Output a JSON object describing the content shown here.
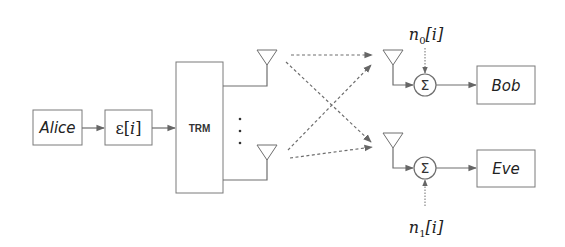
{
  "diagram": {
    "type": "block-diagram",
    "colors": {
      "stroke": "#6e6e6e",
      "box_border": "#7a7a7a",
      "text": "#222222",
      "background": "#ffffff"
    },
    "blocks": {
      "alice": {
        "label": "Alice"
      },
      "epsilon": {
        "label": "ε[i]",
        "symbol": "ε",
        "index": "i"
      },
      "trm": {
        "label": "TRM"
      },
      "bob": {
        "label": "Bob"
      },
      "eve": {
        "label": "Eve"
      }
    },
    "summers": [
      {
        "id": "sum-bob",
        "symbol": "Σ"
      },
      {
        "id": "sum-eve",
        "symbol": "Σ"
      }
    ],
    "noise": [
      {
        "id": "n0",
        "base": "n",
        "subscript": "0",
        "index": "i"
      },
      {
        "id": "n1",
        "base": "n",
        "subscript": "1",
        "index": "i"
      }
    ],
    "antennas": {
      "transmit": [
        "tx-antenna-top",
        "tx-antenna-bottom"
      ],
      "receive": [
        "rx-antenna-bob",
        "rx-antenna-eve"
      ]
    },
    "ellipsis": "⋮",
    "edges": [
      {
        "from": "Alice",
        "to": "ε[i]",
        "style": "solid"
      },
      {
        "from": "ε[i]",
        "to": "TRM",
        "style": "solid"
      },
      {
        "from": "TRM",
        "to": "tx-antenna-top",
        "style": "solid"
      },
      {
        "from": "TRM",
        "to": "tx-antenna-bottom",
        "style": "solid"
      },
      {
        "from": "tx-antenna-top",
        "to": "rx-antenna-bob",
        "style": "dashed"
      },
      {
        "from": "tx-antenna-top",
        "to": "rx-antenna-eve",
        "style": "dashed"
      },
      {
        "from": "tx-antenna-bottom",
        "to": "rx-antenna-bob",
        "style": "dashed"
      },
      {
        "from": "tx-antenna-bottom",
        "to": "rx-antenna-eve",
        "style": "dashed"
      },
      {
        "from": "rx-antenna-bob",
        "to": "sum-bob",
        "style": "solid"
      },
      {
        "from": "rx-antenna-eve",
        "to": "sum-eve",
        "style": "solid"
      },
      {
        "from": "n0[i]",
        "to": "sum-bob",
        "style": "dotted"
      },
      {
        "from": "n1[i]",
        "to": "sum-eve",
        "style": "dotted"
      },
      {
        "from": "sum-bob",
        "to": "Bob",
        "style": "solid"
      },
      {
        "from": "sum-eve",
        "to": "Eve",
        "style": "solid"
      }
    ]
  }
}
